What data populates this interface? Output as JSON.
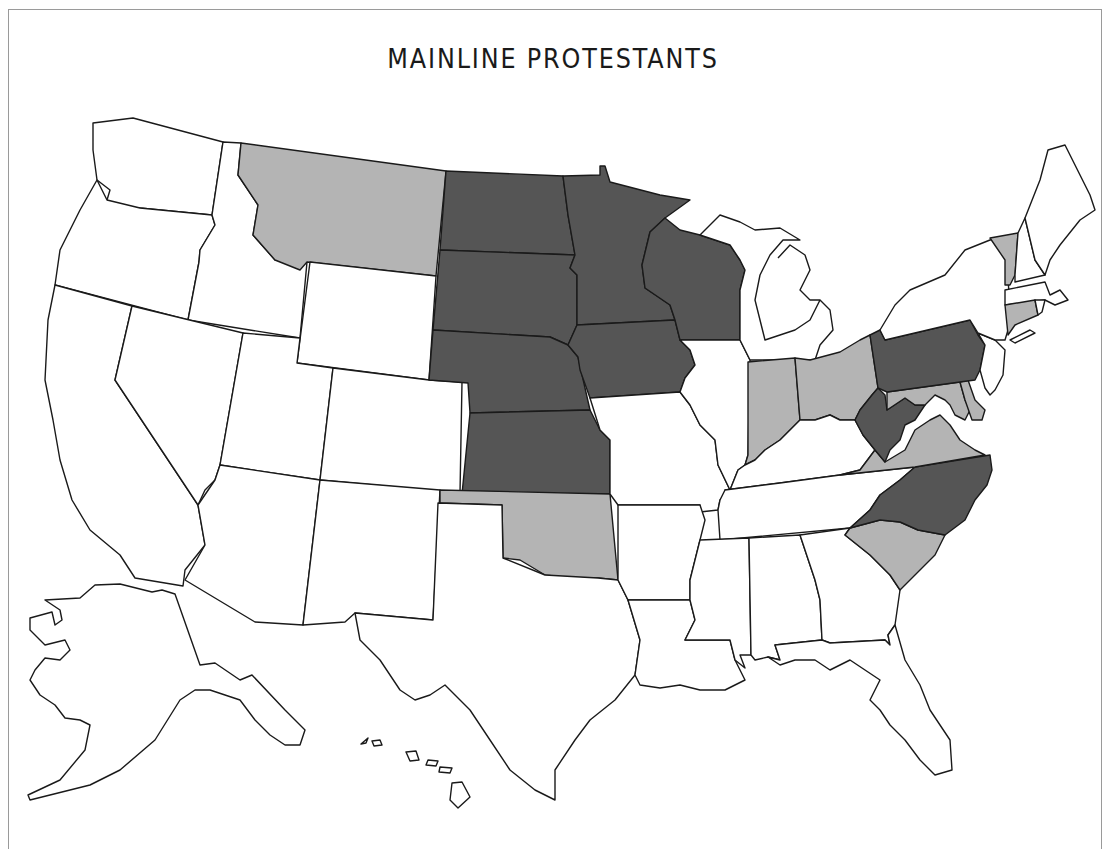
{
  "title": "MAINLINE PROTESTANTS",
  "colors": {
    "high": "#555555",
    "medium": "#b4b4b4",
    "low": "#ffffff",
    "stroke": "#1a1a1a"
  },
  "legend_categories": {
    "high": [
      "North Dakota",
      "South Dakota",
      "Nebraska",
      "Kansas",
      "Minnesota",
      "Iowa",
      "Wisconsin",
      "Pennsylvania",
      "West Virginia",
      "North Carolina"
    ],
    "medium": [
      "Montana",
      "Oklahoma",
      "Indiana",
      "Ohio",
      "Virginia",
      "Maryland",
      "Delaware",
      "South Carolina",
      "Vermont",
      "Connecticut"
    ],
    "low": [
      "Washington",
      "Oregon",
      "California",
      "Idaho",
      "Nevada",
      "Utah",
      "Arizona",
      "Wyoming",
      "Colorado",
      "New Mexico",
      "Texas",
      "Missouri",
      "Arkansas",
      "Louisiana",
      "Illinois",
      "Michigan",
      "Kentucky",
      "Tennessee",
      "Mississippi",
      "Alabama",
      "Georgia",
      "Florida",
      "New York",
      "New Jersey",
      "Massachusetts",
      "New Hampshire",
      "Maine",
      "Rhode Island",
      "Alaska",
      "Hawaii"
    ]
  },
  "states": [
    {
      "id": "WA",
      "name": "Washington",
      "level": "low",
      "d": "M93,123 L133,118 L223,142 L212,215 L140,208 L114,210 L107,200 L110,190 L97,180 L93,150 Z"
    },
    {
      "id": "OR",
      "name": "Oregon",
      "level": "low",
      "d": "M97,180 L107,200 L140,208 L212,215 L215,225 L200,250 L199,262 L188,320 L55,285 L60,250 L80,210 Z"
    },
    {
      "id": "CA",
      "name": "California",
      "level": "low",
      "d": "M55,285 L132,306 L115,380 L198,505 L205,545 L185,570 L183,586 L135,578 L120,555 L90,530 L72,500 L60,460 L53,420 L45,380 L48,320 Z"
    },
    {
      "id": "ID",
      "name": "Idaho",
      "level": "low",
      "d": "M223,142 L241,143 L238,175 L258,205 L253,235 L275,260 L307,262 L300,338 L188,320 L199,262 L200,250 L215,225 L212,215 Z"
    },
    {
      "id": "NV",
      "name": "Nevada",
      "level": "low",
      "d": "M132,306 L243,333 L220,465 L215,480 L205,490 L198,505 L115,380 Z"
    },
    {
      "id": "MT",
      "name": "Montana",
      "level": "medium",
      "d": "M241,143 L446,171 L436,276 L307,262 L300,270 L275,260 L253,235 L258,205 L238,175 Z"
    },
    {
      "id": "WY",
      "name": "Wyoming",
      "level": "low",
      "d": "M310,262 L436,276 L429,380 L297,363 Z"
    },
    {
      "id": "UT",
      "name": "Utah",
      "level": "low",
      "d": "M243,333 L300,338 L297,363 L333,368 L320,480 L220,465 Z"
    },
    {
      "id": "CO",
      "name": "Colorado",
      "level": "low",
      "d": "M333,368 L429,380 L462,382 L460,493 L320,480 Z"
    },
    {
      "id": "AZ",
      "name": "Azizona",
      "level": "low",
      "d": "M220,465 L320,480 L303,625 L255,622 L185,580 L205,545 L198,505 L215,480 Z"
    },
    {
      "id": "NM",
      "name": "New Mexico",
      "level": "low",
      "d": "M320,480 L440,490 L433,620 L355,613 L345,622 L303,625 Z"
    },
    {
      "id": "ND",
      "name": "North Dakota",
      "level": "high",
      "d": "M446,171 L563,176 L568,215 L575,255 L440,250 Z"
    },
    {
      "id": "SD",
      "name": "South Dakota",
      "level": "high",
      "d": "M440,250 L575,255 L570,268 L577,275 L577,325 L568,345 L550,337 L433,330 Z"
    },
    {
      "id": "NE",
      "name": "Nebraska",
      "level": "high",
      "d": "M433,330 L550,337 L568,345 L578,357 L590,410 L470,413 L468,383 L429,380 Z"
    },
    {
      "id": "KS",
      "name": "Kansas",
      "level": "high",
      "d": "M470,413 L590,410 L600,430 L610,440 L610,494 L462,494 Z"
    },
    {
      "id": "OK",
      "name": "Oklahoma",
      "level": "medium",
      "d": "M440,490 L610,494 L618,580 L598,578 L570,578 L545,575 L520,560 L503,558 L502,505 L440,503 Z"
    },
    {
      "id": "TX",
      "name": "Texas",
      "level": "low",
      "d": "M438,503 L502,505 L503,558 L545,575 L598,578 L618,580 L628,600 L640,640 L635,675 L615,700 L590,720 L575,740 L555,770 L555,800 L535,790 L510,770 L490,740 L470,710 L445,685 L430,695 L415,700 L400,690 L380,660 L360,640 L355,613 L433,620 Z"
    },
    {
      "id": "MN",
      "name": "Minnesota",
      "level": "high",
      "d": "M563,176 L600,175 L600,166 L605,166 L610,182 L660,195 L690,200 L665,218 L650,232 L642,265 L645,288 L670,305 L675,320 L577,325 L577,275 L570,268 L575,255 L568,215 Z"
    },
    {
      "id": "IA",
      "name": "Iowa",
      "level": "high",
      "d": "M577,325 L675,320 L680,340 L690,350 L695,365 L685,378 L680,392 L590,398 L580,370 L578,357 L568,345 Z"
    },
    {
      "id": "MO",
      "name": "Missouri",
      "level": "low",
      "d": "M590,398 L680,392 L690,405 L700,425 L715,440 L718,465 L730,490 L720,500 L718,510 L700,512 L700,505 L618,505 L610,494 L610,440 L600,430 Z"
    },
    {
      "id": "AR",
      "name": "Arkansas",
      "level": "low",
      "d": "M618,505 L700,505 L705,520 L700,540 L695,560 L690,580 L690,600 L628,600 L618,580 Z"
    },
    {
      "id": "LA",
      "name": "Louisiana",
      "level": "low",
      "d": "M628,600 L690,600 L695,620 L685,640 L730,640 L735,660 L745,680 L725,690 L700,690 L680,685 L660,688 L640,685 L635,675 L640,640 Z"
    },
    {
      "id": "WI",
      "name": "Wisconsin",
      "level": "high",
      "d": "M650,232 L665,218 L680,230 L700,235 L730,245 L740,260 L745,270 L740,290 L740,340 L680,340 L675,320 L670,305 L645,288 L642,265 Z"
    },
    {
      "id": "IL",
      "name": "Illinois",
      "level": "low",
      "d": "M680,340 L740,340 L750,360 L748,455 L745,465 L738,470 L730,490 L718,465 L715,440 L700,425 L690,405 L680,392 L685,378 L695,365 L690,350 Z"
    },
    {
      "id": "MI",
      "name": "Michigan",
      "level": "low",
      "d": "M700,235 L720,215 L740,222 L755,230 L780,228 L800,240 L783,240 L770,255 L760,275 L755,300 L765,340 L780,335 L795,330 L810,320 L820,300 L830,310 L833,330 L820,345 L815,360 L750,360 L740,340 L740,290 L745,270 L740,260 L730,245 Z M778,258 L790,245 L805,255 L810,270 L800,290 L810,300 L820,300"
    },
    {
      "id": "IN",
      "name": "Indiana",
      "level": "medium",
      "d": "M748,362 L795,358 L800,420 L790,430 L780,440 L765,450 L755,460 L745,465 L748,455 Z"
    },
    {
      "id": "OH",
      "name": "Ohio",
      "level": "medium",
      "d": "M795,358 L810,360 L840,352 L860,340 L870,335 L878,388 L872,395 L860,410 L855,420 L840,420 L830,415 L815,420 L800,420 Z"
    },
    {
      "id": "KY",
      "name": "Kentucky",
      "level": "low",
      "d": "M745,465 L755,460 L765,450 L780,440 L790,430 L800,420 L815,420 L830,415 L840,420 L855,420 L863,435 L875,450 L860,470 L840,475 L780,483 L725,490 L730,490 L738,470 Z"
    },
    {
      "id": "TN",
      "name": "Tennessee",
      "level": "low",
      "d": "M725,490 L780,483 L840,475 L915,467 L900,480 L880,495 L870,510 L850,528 L720,540 L718,510 L720,500 Z"
    },
    {
      "id": "MS",
      "name": "Mississippi",
      "level": "low",
      "d": "M700,540 L749,538 L751,655 L740,655 L745,668 L735,660 L730,640 L685,640 L695,620 L690,600 L690,580 L695,560 Z"
    },
    {
      "id": "AL",
      "name": "Alabama",
      "level": "low",
      "d": "M749,538 L800,535 L815,580 L820,600 L822,640 L775,645 L780,660 L768,657 L755,660 L751,655 Z"
    },
    {
      "id": "GA",
      "name": "Georgia",
      "level": "low",
      "d": "M800,535 L850,528 L845,535 L870,555 L890,575 L900,590 L895,625 L888,635 L890,645 L885,640 L830,643 L822,640 L820,600 L815,580 Z"
    },
    {
      "id": "FL",
      "name": "Florida",
      "level": "low",
      "d": "M768,657 L780,660 L775,645 L822,640 L830,643 L885,640 L890,645 L888,635 L895,625 L905,660 L920,685 L930,710 L950,740 L952,770 L935,775 L920,760 L905,740 L890,725 L880,710 L870,700 L880,680 L865,670 L850,660 L830,670 L815,660 L795,660 L780,665 Z"
    },
    {
      "id": "SC",
      "name": "South Carolina",
      "level": "medium",
      "d": "M850,528 L880,520 L900,522 L918,530 L945,535 L935,555 L920,570 L905,585 L900,590 L890,575 L870,555 L845,535 Z"
    },
    {
      "id": "NC",
      "name": "North Carolina",
      "level": "medium_override",
      "d": "M870,510 L880,495 L900,480 L915,467 L990,455 L992,470 L987,485 L975,500 L965,520 L945,535 L918,530 L900,522 L880,520 L850,528 Z"
    },
    {
      "id": "VA",
      "name": "Virginia",
      "level": "medium",
      "d": "M840,475 L860,470 L875,450 L885,462 L905,450 L915,430 L930,420 L940,415 L950,425 L960,440 L975,450 L985,455 L915,467 Z"
    },
    {
      "id": "WV",
      "name": "West Virginia",
      "level": "high",
      "d": "M872,395 L878,388 L885,395 L887,410 L905,398 L915,405 L925,405 L915,420 L905,425 L900,440 L890,450 L885,462 L875,450 L863,435 L855,420 L860,410 Z"
    },
    {
      "id": "MD",
      "name": "Maryland",
      "level": "medium",
      "d": "M887,392 L960,382 L965,400 L970,410 L965,420 L955,415 L950,405 L945,400 L935,395 L925,405 L915,405 L905,398 L887,410 Z"
    },
    {
      "id": "DE",
      "name": "Delaware",
      "level": "medium",
      "d": "M960,382 L968,380 L975,400 L985,410 L982,420 L972,420 L965,400 Z"
    },
    {
      "id": "PA",
      "name": "Pennsylvania",
      "level": "high",
      "d": "M870,335 L880,330 L885,340 L970,320 L978,335 L985,345 L980,370 L975,380 L960,382 L887,392 L878,388 Z"
    },
    {
      "id": "NJ",
      "name": "New Jersey",
      "level": "low",
      "d": "M978,333 L995,340 L1005,350 L1003,375 L995,390 L990,395 L985,388 L980,370 L985,345 Z"
    },
    {
      "id": "NY",
      "name": "New York",
      "level": "low",
      "d": "M880,330 L895,305 L910,290 L945,275 L965,250 L990,240 L1005,238 L1008,280 L1010,305 L1008,330 L1005,340 L995,340 L978,333 L970,320 L885,340 Z"
    },
    {
      "id": "VT",
      "name": "Vermont",
      "level": "medium",
      "d": "M990,238 L1018,233 L1015,275 L1010,285 L1005,285 L1005,260 Z"
    },
    {
      "id": "NH",
      "name": "New Hampshire",
      "level": "low",
      "d": "M1018,233 L1025,218 L1035,260 L1045,275 L1015,282 L1015,275 Z"
    },
    {
      "id": "ME",
      "name": "Maine",
      "level": "low",
      "d": "M1025,218 L1040,180 L1048,150 L1065,145 L1075,165 L1090,195 L1095,210 L1080,220 L1060,245 L1050,260 L1045,275 L1035,260 Z"
    },
    {
      "id": "MA",
      "name": "Massachusetts",
      "level": "low",
      "d": "M1005,290 L1045,282 L1050,295 L1060,290 L1068,300 L1055,305 L1045,300 L1005,305 Z"
    },
    {
      "id": "CT",
      "name": "Connecticut",
      "level": "medium",
      "d": "M1005,305 L1035,300 L1038,315 L1015,325 L1008,335 Z"
    },
    {
      "id": "RI",
      "name": "Rhode Island",
      "level": "low",
      "d": "M1035,300 L1045,300 L1042,312 L1038,315 Z"
    },
    {
      "id": "LI",
      "name": "Long Island",
      "level": "low",
      "d": "M1010,340 L1030,330 L1035,333 L1015,343 Z"
    },
    {
      "id": "AK",
      "name": "Alaska",
      "level": "low",
      "d": "M80,598 L95,585 L120,584 L152,592 L162,590 L175,594 L200,665 L215,663 L240,680 L252,675 L285,710 L305,730 L300,745 L285,745 L270,735 L255,720 L240,700 L225,695 L210,690 L195,690 L180,700 L155,740 L120,770 L90,785 L30,800 L28,795 L60,780 L85,750 L90,725 L80,720 L65,718 L55,705 L40,695 L30,680 L35,670 L45,658 L60,660 L70,650 L65,640 L45,645 L30,630 L30,618 L52,612 L55,625 L62,620 L60,610 L45,600 Z"
    },
    {
      "id": "HI1",
      "name": "Hawaii (Kauai)",
      "level": "low",
      "d": "M361,744 L368,738 L366,743 Z"
    },
    {
      "id": "HI2",
      "name": "Hawaii (Oahu)",
      "level": "low",
      "d": "M372,741 L380,740 L382,745 L374,746 Z"
    },
    {
      "id": "HI3",
      "name": "Hawaii (Molokai/Maui)",
      "level": "low",
      "d": "M406,752 L416,751 L419,760 L410,761 Z M428,760 L438,761 L436,766 L426,765 Z M440,767 L452,768 L450,773 L439,772 Z"
    },
    {
      "id": "HI4",
      "name": "Hawaii (Big Island)",
      "level": "low",
      "d": "M452,783 L462,782 L470,797 L458,808 L450,800 Z"
    }
  ]
}
